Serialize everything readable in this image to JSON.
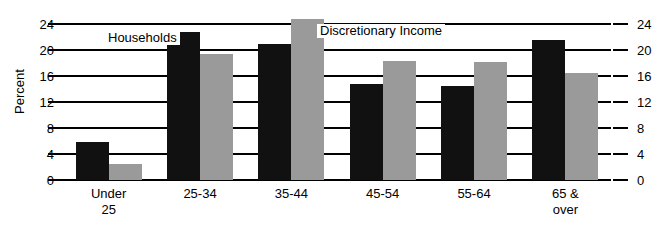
{
  "chart_data": {
    "type": "bar",
    "title": "",
    "xlabel": "",
    "ylabel": "Percent",
    "ylim": [
      0,
      24
    ],
    "yticks": [
      0,
      4,
      8,
      12,
      16,
      20,
      24
    ],
    "ytick_labels": [
      "0",
      "4",
      "8",
      "12",
      "16",
      "20",
      "24"
    ],
    "grid": true,
    "legend_position": "inline-annotation",
    "categories": [
      "Under 25",
      "25-34",
      "35-44",
      "45-54",
      "55-64",
      "65 & over"
    ],
    "category_lines": [
      [
        "Under",
        "25"
      ],
      [
        "25-34",
        ""
      ],
      [
        "35-44",
        ""
      ],
      [
        "45-54",
        ""
      ],
      [
        "55-64",
        ""
      ],
      [
        "65 &",
        "over"
      ]
    ],
    "series": [
      {
        "name": "Households",
        "color": "#111111",
        "values": [
          5.9,
          22.7,
          21.0,
          14.7,
          14.4,
          21.6
        ]
      },
      {
        "name": "Discretionary Income",
        "color": "#9a9a9a",
        "values": [
          2.5,
          19.4,
          24.7,
          18.3,
          18.2,
          16.4
        ]
      }
    ],
    "annotations": [
      {
        "text": "Households",
        "series": "Households"
      },
      {
        "text": "Discretionary Income",
        "series": "Discretionary Income"
      }
    ]
  },
  "axes": {
    "y_title": "Percent",
    "left_ticks": [
      "24",
      "20",
      "16",
      "12",
      "8",
      "4",
      "0"
    ],
    "right_ticks": [
      "24",
      "20",
      "16",
      "12",
      "8",
      "4",
      "0"
    ]
  },
  "colors": {
    "households": "#111111",
    "discretionary": "#9a9a9a",
    "axis": "#000000",
    "background": "#ffffff"
  }
}
